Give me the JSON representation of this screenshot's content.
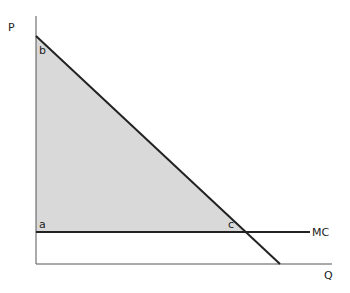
{
  "diagram": {
    "axes": {
      "y_label": "P",
      "x_label": "Q"
    },
    "points": {
      "b": "b",
      "a": "a",
      "c": "c"
    },
    "curves": {
      "mc_label": "MC"
    },
    "colors": {
      "shade": "#d9d9d9",
      "line": "#222222",
      "axis": "#555555"
    }
  }
}
